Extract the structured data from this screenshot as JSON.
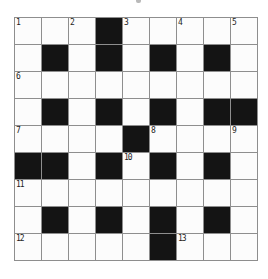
{
  "puzzle": {
    "title": "crossword-grid",
    "rows": 9,
    "cols": 9,
    "black_cells": [
      [
        1,
        4
      ],
      [
        2,
        2
      ],
      [
        2,
        4
      ],
      [
        2,
        6
      ],
      [
        2,
        8
      ],
      [
        4,
        2
      ],
      [
        4,
        4
      ],
      [
        4,
        6
      ],
      [
        4,
        8
      ],
      [
        4,
        9
      ],
      [
        5,
        5
      ],
      [
        6,
        1
      ],
      [
        6,
        2
      ],
      [
        6,
        4
      ],
      [
        6,
        6
      ],
      [
        6,
        8
      ],
      [
        8,
        2
      ],
      [
        8,
        4
      ],
      [
        8,
        6
      ],
      [
        8,
        8
      ],
      [
        9,
        6
      ]
    ],
    "numbers": [
      {
        "num": "1",
        "row": 1,
        "col": 1
      },
      {
        "num": "2",
        "row": 1,
        "col": 3
      },
      {
        "num": "3",
        "row": 1,
        "col": 5
      },
      {
        "num": "4",
        "row": 1,
        "col": 7
      },
      {
        "num": "5",
        "row": 1,
        "col": 9
      },
      {
        "num": "6",
        "row": 3,
        "col": 1
      },
      {
        "num": "7",
        "row": 5,
        "col": 1
      },
      {
        "num": "8",
        "row": 5,
        "col": 6
      },
      {
        "num": "9",
        "row": 5,
        "col": 9
      },
      {
        "num": "10",
        "row": 6,
        "col": 5
      },
      {
        "num": "11",
        "row": 7,
        "col": 1
      },
      {
        "num": "12",
        "row": 9,
        "col": 1
      },
      {
        "num": "13",
        "row": 9,
        "col": 7
      }
    ],
    "colors": {
      "page_background": "#ffffff",
      "grid_line": "#8e8e8e",
      "black_cell": "#141414",
      "white_cell": "#fcfcfc",
      "number_text": "#1c1c1c"
    }
  }
}
